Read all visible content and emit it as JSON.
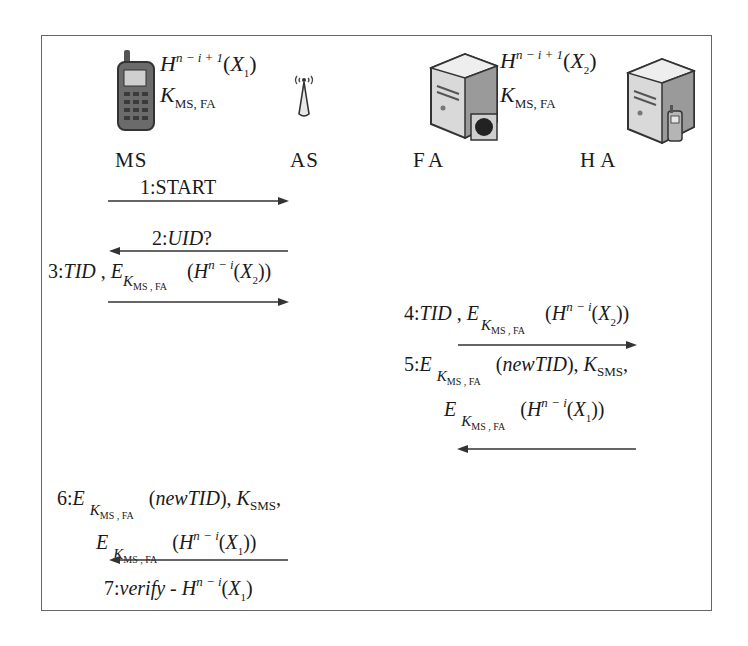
{
  "entities": [
    {
      "id": "ms",
      "label": "MS",
      "icon": "mobile-phone-icon"
    },
    {
      "id": "as",
      "label": "AS",
      "icon": "antenna-icon"
    },
    {
      "id": "fa",
      "label": "FA",
      "icon": "server-icon"
    },
    {
      "id": "ha",
      "label": "HA",
      "icon": "server-with-phone-icon"
    }
  ],
  "ms_state": {
    "hash_base": "H",
    "hash_exp": "n − i + 1",
    "hash_arg": "X",
    "hash_arg_sub": "1",
    "key": "K",
    "key_sub": "MS, FA"
  },
  "fa_state": {
    "hash_base": "H",
    "hash_exp": "n − i + 1",
    "hash_arg": "X",
    "hash_arg_sub": "2",
    "key": "K",
    "key_sub": "MS, FA"
  },
  "messages": [
    {
      "step": "1",
      "text": "1:START",
      "from": "MS",
      "to": "AS",
      "direction": "right"
    },
    {
      "step": "2",
      "text": "2:UID?",
      "from": "AS",
      "to": "MS",
      "direction": "left"
    },
    {
      "step": "3",
      "prefix": "3:",
      "text": "TID , E_{K_{MS,FA}} (H^{n-i}(X_2))",
      "from": "MS",
      "to": "AS",
      "direction": "right"
    },
    {
      "step": "4",
      "prefix": "4:",
      "text": "TID , E_{K_{MS,FA}} (H^{n-i}(X_2))",
      "from": "AS",
      "to": "FA",
      "direction": "right"
    },
    {
      "step": "5",
      "prefix": "5:",
      "line1": "E_{K_{MS,FA}} (newTID), K_SMS,",
      "line2": "E_{K_{MS,FA}} (H^{n-i}(X_1))",
      "from": "FA",
      "to": "AS",
      "direction": "left"
    },
    {
      "step": "6",
      "prefix": "6:",
      "line1": "E_{K_{MS,FA}} (newTID), K_SMS,",
      "line2": "E_{K_{MS,FA}} (H^{n-i}(X_1))",
      "from": "AS",
      "to": "MS",
      "direction": "left"
    },
    {
      "step": "7",
      "prefix": "7:",
      "text": "verify - H^{n-i}(X_1)"
    }
  ],
  "glyphs": {
    "H": "H",
    "E": "E",
    "K": "K",
    "X": "X",
    "TID": "TID",
    "newTID": "newTID",
    "verify": "verify",
    "UID": "UID",
    "START": "START",
    "exp_ni": "n − i",
    "sub_msfa": "MS , FA",
    "sub_sms": "SMS",
    "one": "1",
    "two": "2"
  }
}
